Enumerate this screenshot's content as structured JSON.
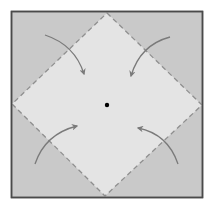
{
  "diagram": {
    "type": "origami-fold-step",
    "colors": {
      "background": "#ffffff",
      "paper_outer": "#c9c9c9",
      "paper_inner": "#e4e4e4",
      "border": "#4a4a4a",
      "fold_line": "#8f8f8f",
      "arrow": "#7a7a7a",
      "center_dot": "#000000"
    },
    "square": {
      "x1": 11,
      "y1": 11,
      "x2": 203,
      "y2": 198
    },
    "diamond": {
      "top": [
        107,
        13
      ],
      "right": [
        202,
        105
      ],
      "bottom": [
        105,
        196
      ],
      "left": [
        12,
        104
      ]
    },
    "center_point": [
      107,
      105
    ],
    "arrows": [
      {
        "name": "top-left-corner-arrow",
        "from": [
          45,
          35
        ],
        "to": [
          84,
          74
        ]
      },
      {
        "name": "top-right-corner-arrow",
        "from": [
          170,
          37
        ],
        "to": [
          131,
          76
        ]
      },
      {
        "name": "bottom-left-corner-arrow",
        "from": [
          35,
          164
        ],
        "to": [
          77,
          126
        ]
      },
      {
        "name": "bottom-right-corner-arrow",
        "from": [
          178,
          164
        ],
        "to": [
          138,
          128
        ]
      }
    ]
  }
}
